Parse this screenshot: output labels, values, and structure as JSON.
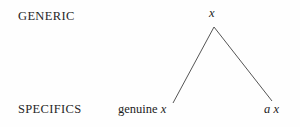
{
  "figure": {
    "background_color": "#fefefe",
    "line_color": "#555555",
    "text_color": "#1c1c1c"
  },
  "rows": {
    "generic_label": "GENERIC",
    "specifics_label": "SPECIFICS"
  },
  "nodes": {
    "root": {
      "variable": "x"
    },
    "left_leaf": {
      "word": "genuine",
      "variable": "x"
    },
    "right_leaf": {
      "modifier": "a",
      "variable": "x"
    }
  },
  "branches": [
    {
      "name": "root-to-left-leaf",
      "x1": 214,
      "y1": 27,
      "x2": 173,
      "y2": 103
    },
    {
      "name": "root-to-right-leaf",
      "x1": 214,
      "y1": 27,
      "x2": 272,
      "y2": 101
    }
  ]
}
